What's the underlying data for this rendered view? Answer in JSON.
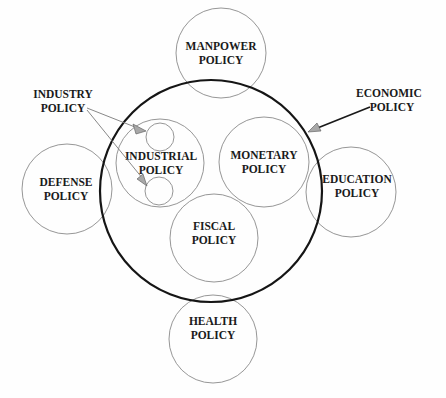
{
  "diagram": {
    "outer_circle": {
      "label": "ECONOMIC POLICY",
      "lines": [
        "ECONOMIC",
        "POLICY"
      ]
    },
    "inner_circles": [
      {
        "id": "industrial",
        "lines": [
          "INDUSTRIAL",
          "POLICY"
        ]
      },
      {
        "id": "monetary",
        "lines": [
          "MONETARY",
          "POLICY"
        ]
      },
      {
        "id": "fiscal",
        "lines": [
          "FISCAL",
          "POLICY"
        ]
      }
    ],
    "sub_circles": {
      "parent": "industrial",
      "count": 2,
      "label_lines": [
        "INDUSTRY",
        "POLICY"
      ]
    },
    "outer_circles": [
      {
        "id": "manpower",
        "lines": [
          "MANPOWER",
          "POLICY"
        ]
      },
      {
        "id": "defense",
        "lines": [
          "DEFENSE",
          "POLICY"
        ]
      },
      {
        "id": "education",
        "lines": [
          "EDUCATION",
          "POLICY"
        ]
      },
      {
        "id": "health",
        "lines": [
          "HEALTH",
          "POLICY"
        ]
      }
    ]
  }
}
